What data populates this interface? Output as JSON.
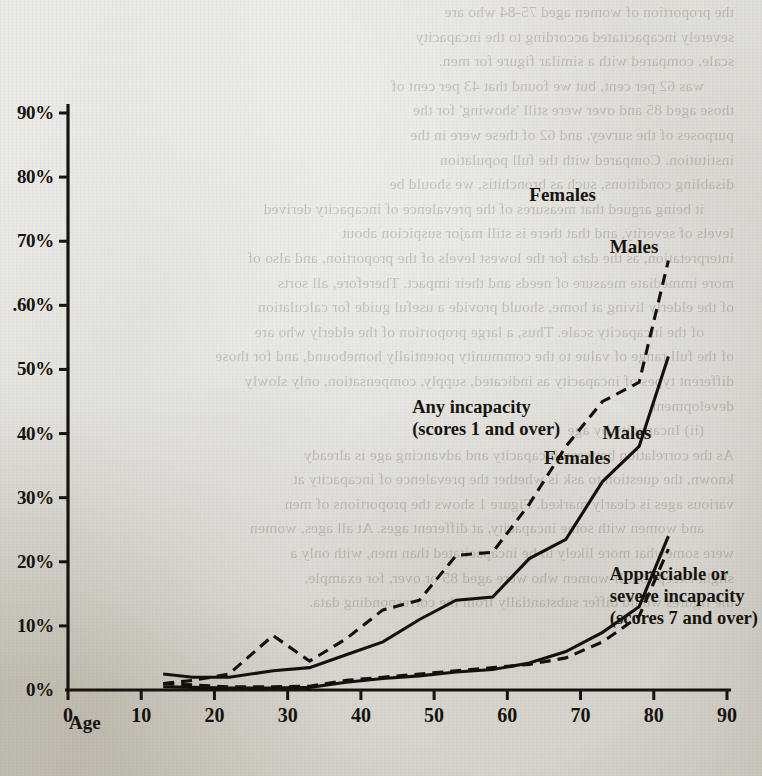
{
  "document": {
    "bleed_lines": [
      "the proportion of women aged 75-84 who are",
      "severely incapacitated according to the incapacity",
      "scale, compared with a similar figure for men.",
      "was 62 per cent, but we found that 43 per cent of",
      "those aged 85 and over were still 'showing' for the",
      "purposes of the survey, and 62 of these were in the",
      "institution. Compared with the full population",
      "disabling conditions, such as bronchitis, we should be",
      "it being argued that measures of the prevalence of incapacity derived",
      "levels of severity, and that there is still major suspicion about",
      "interpretation, as the data for the lowest levels of the proportion, and also of",
      "more immediate measure of needs and their impact. Therefore, all sorts",
      "of the elderly living at home, should provide a useful guide for calculation",
      "of the incapacity scale. Thus, a large proportion of the elderly who are",
      "of the full range of value to the community potentially homebound, and for those",
      "different types of incapacity as indicated, supply, compensation, only slowly",
      "development.",
      "",
      "(ii) Incapacity by age",
      "",
      "As the correlation between incapacity and advancing age is already",
      "known, the question to ask is whether the prevalence of incapacity at",
      "various ages is clearly marked. Figure 1 shows the proportions of men",
      "and women with some incapacity, at different ages. At all ages, women",
      "were somewhat more likely to be incapacitated than men, with only a",
      "slight exception. If women who were aged 85 or over, for example,",
      "the figures would differ substantially from the corresponding data."
    ]
  },
  "chart_data": {
    "type": "line",
    "title": "",
    "xlabel": "Age",
    "ylabel": "",
    "xlim": [
      0,
      90
    ],
    "ylim": [
      0,
      95
    ],
    "grid": false,
    "legend_position": "inline-annotations",
    "x_ticks": [
      "0",
      "10",
      "20",
      "30",
      "40",
      "50",
      "60",
      "70",
      "80",
      "90"
    ],
    "x_tick_values": [
      0,
      10,
      20,
      30,
      40,
      50,
      60,
      70,
      80,
      90
    ],
    "y_ticks": [
      "0%",
      "10%",
      "20%",
      "30%",
      "40%",
      "50%",
      ".60%",
      "70%",
      "80%",
      "90%"
    ],
    "y_tick_values": [
      0,
      10,
      20,
      30,
      40,
      50,
      60,
      70,
      80,
      90
    ],
    "annotations": [
      {
        "id": "ann-any-incapacity",
        "text": "Any incapacity\n(scores 1 and over)",
        "x": 47,
        "y": 44
      },
      {
        "id": "ann-severe-incapacity",
        "text": "Appreciable or\nsevere incapacity\n(scores 7 and over)",
        "x": 74,
        "y": 18
      },
      {
        "id": "ann-any-females",
        "text": "Females",
        "x": 63,
        "y": 77
      },
      {
        "id": "ann-any-males",
        "text": "Males",
        "x": 74,
        "y": 69
      },
      {
        "id": "ann-severe-females",
        "text": "Females",
        "x": 65,
        "y": 36
      },
      {
        "id": "ann-severe-males",
        "text": "Males",
        "x": 73,
        "y": 40
      }
    ],
    "series": [
      {
        "name": "Any incapacity - Females",
        "group": "Any incapacity (scores 1 and over)",
        "sex": "Females",
        "style": "dashed",
        "x": [
          13,
          17,
          22,
          28,
          33,
          38,
          43,
          48,
          53,
          58,
          63,
          68,
          73,
          78,
          82
        ],
        "values": [
          1.0,
          1.5,
          2.5,
          8.5,
          4.5,
          8.0,
          12.5,
          14.0,
          21.0,
          21.5,
          29.0,
          38.0,
          45.0,
          48.0,
          67.0
        ]
      },
      {
        "name": "Any incapacity - Males",
        "group": "Any incapacity (scores 1 and over)",
        "sex": "Males",
        "style": "solid",
        "x": [
          13,
          17,
          22,
          28,
          33,
          38,
          43,
          48,
          53,
          58,
          63,
          68,
          73,
          78,
          82
        ],
        "values": [
          2.5,
          2.0,
          2.0,
          3.0,
          3.5,
          5.5,
          7.5,
          11.0,
          14.0,
          14.5,
          20.5,
          23.5,
          32.5,
          38.0,
          52.0
        ]
      },
      {
        "name": "Appreciable or severe incapacity - Females",
        "group": "Appreciable or severe incapacity (scores 7 and over)",
        "sex": "Females",
        "style": "dashed",
        "x": [
          13,
          17,
          22,
          28,
          33,
          38,
          43,
          48,
          53,
          58,
          63,
          68,
          73,
          78,
          82
        ],
        "values": [
          1.0,
          0.8,
          0.5,
          0.5,
          0.6,
          1.5,
          2.0,
          2.5,
          3.0,
          3.5,
          4.0,
          5.0,
          7.5,
          11.5,
          22.0
        ]
      },
      {
        "name": "Appreciable or severe incapacity - Males",
        "group": "Appreciable or severe incapacity (scores 7 and over)",
        "sex": "Males",
        "style": "solid",
        "x": [
          13,
          17,
          22,
          28,
          33,
          38,
          43,
          48,
          53,
          58,
          63,
          68,
          73,
          78,
          82
        ],
        "values": [
          0.5,
          0.4,
          0.3,
          0.3,
          0.4,
          1.2,
          1.8,
          2.2,
          2.8,
          3.2,
          4.2,
          6.0,
          9.0,
          13.0,
          24.0
        ]
      }
    ]
  }
}
